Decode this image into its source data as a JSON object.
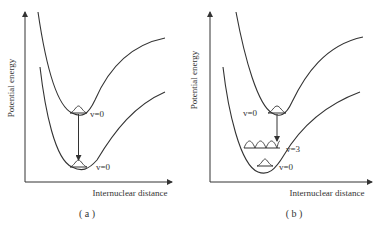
{
  "panels": [
    {
      "id": "a",
      "caption": "( a )",
      "y_axis_label": "Potential energy",
      "x_axis_label": "Internuclear distance",
      "upper_level_label": "v=0",
      "lower_level_label": "v=0"
    },
    {
      "id": "b",
      "caption": "( b )",
      "y_axis_label": "Potential energy",
      "x_axis_label": "Internuclear distance",
      "upper_level_label": "v=0",
      "lower_level_label_high": "v=3",
      "lower_level_label": "v=0"
    }
  ],
  "colors": {
    "line": "#333333",
    "background": "#ffffff"
  }
}
